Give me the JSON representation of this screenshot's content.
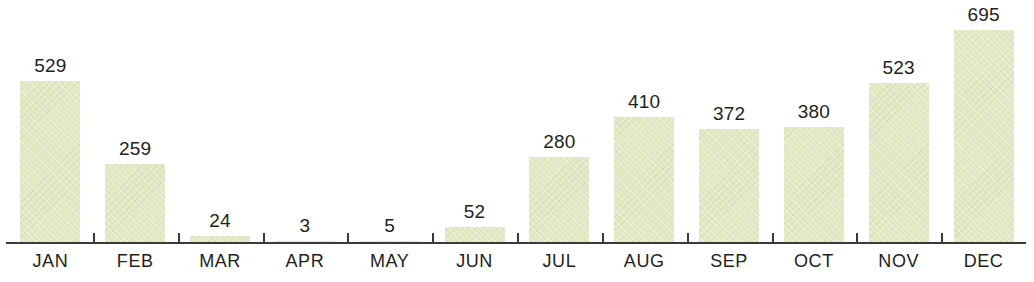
{
  "chart_data": {
    "type": "bar",
    "title": "",
    "subtitle": "",
    "xlabel": "",
    "ylabel": "",
    "categories": [
      "JAN",
      "FEB",
      "MAR",
      "APR",
      "MAY",
      "JUN",
      "JUL",
      "AUG",
      "SEP",
      "OCT",
      "NOV",
      "DEC"
    ],
    "values": [
      529,
      259,
      24,
      3,
      5,
      52,
      280,
      410,
      372,
      380,
      523,
      695
    ],
    "value_labels": [
      "529",
      "259",
      "24",
      "3",
      "5",
      "52",
      "280",
      "410",
      "372",
      "380",
      "523",
      "695"
    ],
    "ylim": [
      0,
      695
    ],
    "grid": false,
    "legend": false,
    "legend_position": "none",
    "data_labels": true,
    "data_label_position": "above-bar",
    "axis": {
      "x_axis_visible": true,
      "y_axis_visible": false,
      "tick_marks": "category-boundaries",
      "tick_count": 11
    },
    "colors": {
      "bar_fill": "#e2e8c3",
      "bar_texture": "#b6c18c",
      "axis_line": "#3a3a38",
      "label_text": "#231f20",
      "value_text": "#231f20",
      "background": "#ffffff"
    }
  }
}
